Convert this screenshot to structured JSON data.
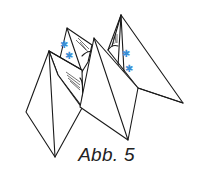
{
  "figure": {
    "caption": "Abb. 5",
    "decoration_symbol": "✱",
    "colors": {
      "line": "#1a1a1a",
      "star": "#3a8fd6",
      "background": "#ffffff"
    }
  }
}
